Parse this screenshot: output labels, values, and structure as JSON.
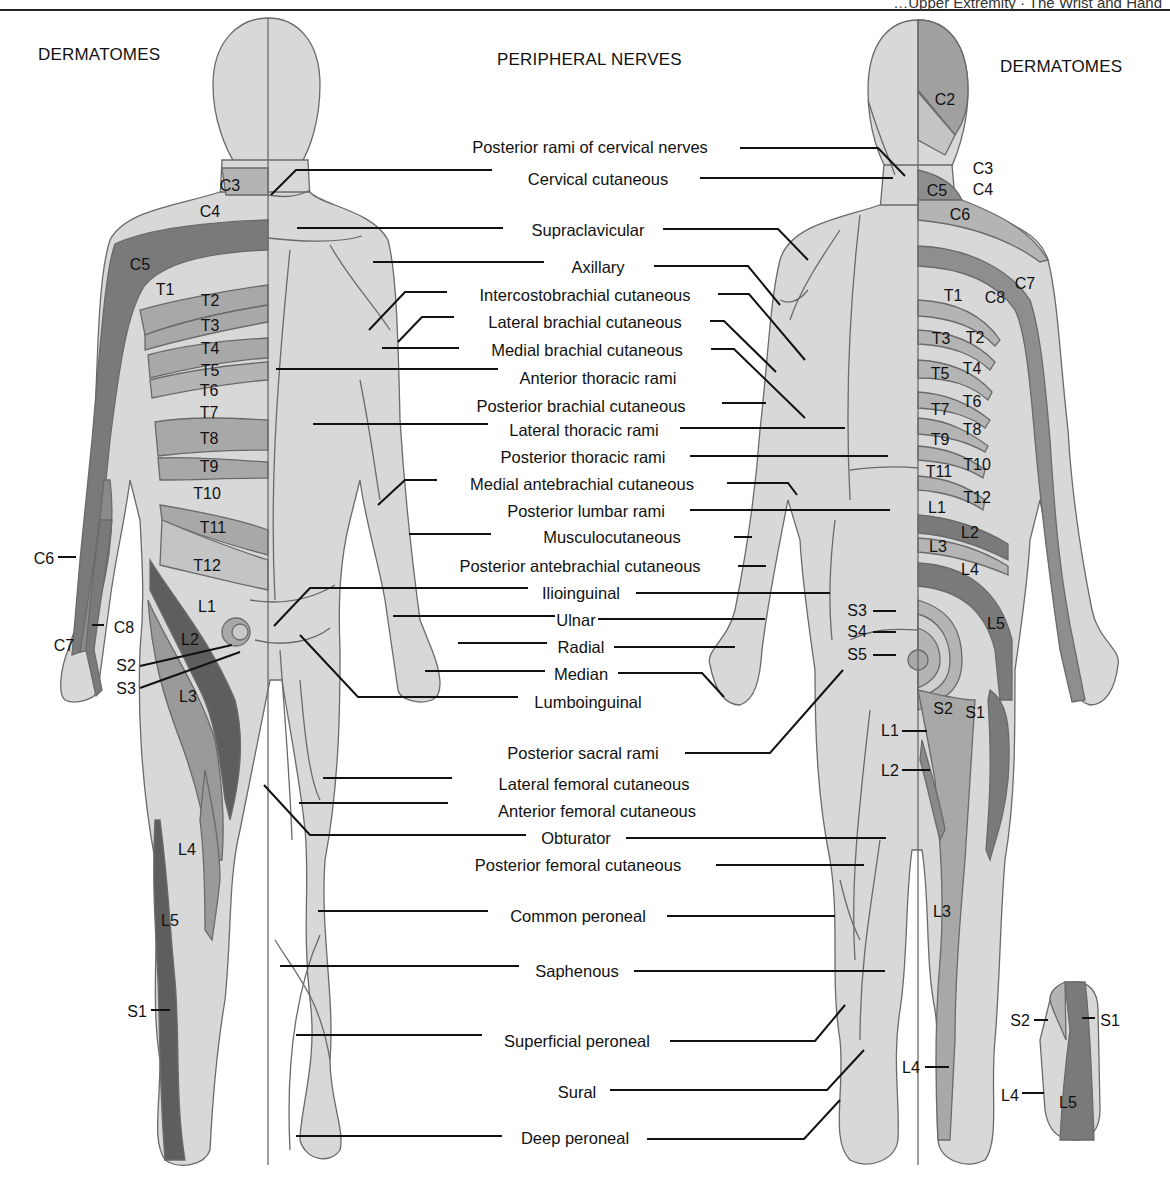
{
  "header": {
    "running_head": "…Upper Extremity  ·  The Wrist and Hand",
    "left_heading": "DERMATOMES",
    "center_heading": "PERIPHERAL NERVES",
    "right_heading": "DERMATOMES"
  },
  "colors": {
    "skin": "#d8d8d8",
    "band_light": "#ececec",
    "band_mid": "#b4b4b4",
    "band_dark": "#8a8a8a",
    "band_darkest": "#5e5e5e",
    "outline": "#6a6a6a",
    "leader": "#111111"
  },
  "peripheral_nerves": [
    {
      "label": "Posterior rami of cervical nerves",
      "x": 590,
      "y": 138
    },
    {
      "label": "Cervical cutaneous",
      "x": 598,
      "y": 170
    },
    {
      "label": "Supraclavicular",
      "x": 588,
      "y": 221
    },
    {
      "label": "Axillary",
      "x": 587,
      "y": 258
    },
    {
      "label": "Intercostobrachial cutaneous",
      "x": 585,
      "y": 286
    },
    {
      "label": "Lateral brachial cutaneous",
      "x": 585,
      "y": 313
    },
    {
      "label": "Medial brachial cutaneous",
      "x": 587,
      "y": 341
    },
    {
      "label": "Anterior thoracic rami",
      "x": 598,
      "y": 369
    },
    {
      "label": "Posterior brachial cutaneous",
      "x": 581,
      "y": 397
    },
    {
      "label": "Lateral thoracic rami",
      "x": 584,
      "y": 421
    },
    {
      "label": "Posterior thoracic rami",
      "x": 583,
      "y": 448
    },
    {
      "label": "Medial antebrachial cutaneous",
      "x": 582,
      "y": 475
    },
    {
      "label": "Posterior lumbar rami",
      "x": 586,
      "y": 502
    },
    {
      "label": "Musculocutaneous",
      "x": 584,
      "y": 528
    },
    {
      "label": "Posterior antebrachial cutaneous",
      "x": 580,
      "y": 557
    },
    {
      "label": "Ilioinguinal",
      "x": 581,
      "y": 584
    },
    {
      "label": "Ulnar",
      "x": 581,
      "y": 611
    },
    {
      "label": "Radial",
      "x": 582,
      "y": 638
    },
    {
      "label": "Median",
      "x": 580,
      "y": 665
    },
    {
      "label": "Lumboinguinal",
      "x": 588,
      "y": 693
    },
    {
      "label": "Posterior sacral rami",
      "x": 581,
      "y": 744
    },
    {
      "label": "Lateral femoral cutaneous",
      "x": 594,
      "y": 775
    },
    {
      "label": "Anterior femoral cutaneous",
      "x": 597,
      "y": 802
    },
    {
      "label": "Obturator",
      "x": 575,
      "y": 829
    },
    {
      "label": "Posterior femoral cutaneous",
      "x": 578,
      "y": 856
    },
    {
      "label": "Common peroneal",
      "x": 578,
      "y": 907
    },
    {
      "label": "Saphenous",
      "x": 577,
      "y": 962
    },
    {
      "label": "Superficial peroneal",
      "x": 578,
      "y": 1032
    },
    {
      "label": "Sural",
      "x": 577,
      "y": 1083
    },
    {
      "label": "Deep peroneal",
      "x": 574,
      "y": 1129
    }
  ],
  "anterior_dermatomes": [
    {
      "label": "C3",
      "x": 230,
      "y": 186
    },
    {
      "label": "C4",
      "x": 210,
      "y": 212
    },
    {
      "label": "C5",
      "x": 140,
      "y": 265
    },
    {
      "label": "T1",
      "x": 165,
      "y": 290
    },
    {
      "label": "T2",
      "x": 210,
      "y": 301
    },
    {
      "label": "T3",
      "x": 210,
      "y": 326
    },
    {
      "label": "T4",
      "x": 210,
      "y": 349
    },
    {
      "label": "T5",
      "x": 210,
      "y": 371
    },
    {
      "label": "T6",
      "x": 209,
      "y": 391
    },
    {
      "label": "T7",
      "x": 209,
      "y": 413
    },
    {
      "label": "T8",
      "x": 209,
      "y": 439
    },
    {
      "label": "T9",
      "x": 209,
      "y": 467
    },
    {
      "label": "T10",
      "x": 207,
      "y": 494
    },
    {
      "label": "T11",
      "x": 213,
      "y": 528
    },
    {
      "label": "T12",
      "x": 207,
      "y": 566
    },
    {
      "label": "L1",
      "x": 207,
      "y": 607
    },
    {
      "label": "L2",
      "x": 190,
      "y": 640
    },
    {
      "label": "L3",
      "x": 188,
      "y": 697
    },
    {
      "label": "L4",
      "x": 187,
      "y": 850
    },
    {
      "label": "L5",
      "x": 170,
      "y": 921
    },
    {
      "label": "C6",
      "x": 47,
      "y": 559
    },
    {
      "label": "C7",
      "x": 64,
      "y": 646
    },
    {
      "label": "C8",
      "x": 126,
      "y": 628
    },
    {
      "label": "S2",
      "x": 125,
      "y": 666
    },
    {
      "label": "S3",
      "x": 125,
      "y": 689
    },
    {
      "label": "S1",
      "x": 138,
      "y": 1012
    }
  ],
  "posterior_dermatomes": [
    {
      "label": "C2",
      "x": 945,
      "y": 100
    },
    {
      "label": "C3",
      "x": 983,
      "y": 169
    },
    {
      "label": "C4",
      "x": 983,
      "y": 190
    },
    {
      "label": "C5",
      "x": 937,
      "y": 191
    },
    {
      "label": "C6",
      "x": 960,
      "y": 215
    },
    {
      "label": "C7",
      "x": 1025,
      "y": 284
    },
    {
      "label": "C8",
      "x": 995,
      "y": 298
    },
    {
      "label": "T1",
      "x": 953,
      "y": 296
    },
    {
      "label": "T2",
      "x": 975,
      "y": 338
    },
    {
      "label": "T3",
      "x": 941,
      "y": 339
    },
    {
      "label": "T4",
      "x": 972,
      "y": 369
    },
    {
      "label": "T5",
      "x": 940,
      "y": 374
    },
    {
      "label": "T6",
      "x": 972,
      "y": 402
    },
    {
      "label": "T7",
      "x": 940,
      "y": 410
    },
    {
      "label": "T8",
      "x": 972,
      "y": 430
    },
    {
      "label": "T9",
      "x": 940,
      "y": 440
    },
    {
      "label": "T10",
      "x": 977,
      "y": 465
    },
    {
      "label": "T11",
      "x": 939,
      "y": 472
    },
    {
      "label": "T12",
      "x": 977,
      "y": 498
    },
    {
      "label": "L1",
      "x": 937,
      "y": 508
    },
    {
      "label": "L2",
      "x": 970,
      "y": 533
    },
    {
      "label": "L3",
      "x": 938,
      "y": 547
    },
    {
      "label": "L4",
      "x": 970,
      "y": 570
    },
    {
      "label": "L5",
      "x": 996,
      "y": 624
    },
    {
      "label": "S3",
      "x": 857,
      "y": 611
    },
    {
      "label": "S4",
      "x": 857,
      "y": 632
    },
    {
      "label": "S5",
      "x": 857,
      "y": 655
    },
    {
      "label": "S2",
      "x": 943,
      "y": 709
    },
    {
      "label": "S1",
      "x": 975,
      "y": 713
    },
    {
      "label": "L1",
      "x": 890,
      "y": 731
    },
    {
      "label": "L2",
      "x": 890,
      "y": 771
    },
    {
      "label": "L3",
      "x": 942,
      "y": 912
    },
    {
      "label": "L4",
      "x": 911,
      "y": 1068
    },
    {
      "label": "S2",
      "x": 1020,
      "y": 1021
    },
    {
      "label": "S1",
      "x": 1110,
      "y": 1021
    },
    {
      "label": "L4",
      "x": 1010,
      "y": 1096
    },
    {
      "label": "L5",
      "x": 1068,
      "y": 1103
    }
  ]
}
